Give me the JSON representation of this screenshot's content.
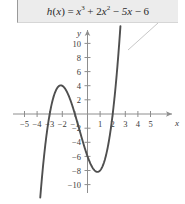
{
  "figure": {
    "name": "cubic-function-graph",
    "callout": {
      "equation_plain": "h(x) = x^3 + 2x^2 - 5x - 6",
      "lhs": "h",
      "lhs_arg_open": "(",
      "lhs_var": "x",
      "lhs_arg_close": ")",
      "equals": "=",
      "term1_base": "x",
      "term1_exp": "3",
      "op1": "+",
      "term2_coef": "2",
      "term2_base": "x",
      "term2_exp": "2",
      "op2": "−",
      "term3": "5x",
      "op3": "−",
      "term4": "6"
    },
    "axes": {
      "x_label": "x",
      "y_label": "y",
      "x_ticks": [
        "−5",
        "−4",
        "−3",
        "−2",
        "−1",
        "1",
        "2",
        "3",
        "4",
        "5"
      ],
      "y_ticks": [
        "10",
        "8",
        "6",
        "4",
        "2",
        "−2",
        "−4",
        "−6",
        "−8",
        "−10"
      ]
    }
  },
  "chart_data": {
    "type": "line",
    "xlabel": "x",
    "ylabel": "y",
    "xlim": [
      -5.6,
      5.6
    ],
    "ylim": [
      -11.5,
      12.5
    ],
    "xticks": [
      -5,
      -4,
      -3,
      -2,
      -1,
      1,
      2,
      3,
      4,
      5
    ],
    "yticks": [
      10,
      8,
      6,
      4,
      2,
      -2,
      -4,
      -6,
      -8,
      -10
    ],
    "grid": false,
    "legend": false,
    "series": [
      {
        "name": "h(x) = x^3 + 2x^2 - 5x - 6",
        "color": "#4f4f4f",
        "expression": "x**3 + 2*x**2 - 5*x - 6",
        "x": [
          -4.3,
          -4.1,
          -3.9,
          -3.7,
          -3.5,
          -3.3,
          -3.1,
          -2.9,
          -2.7,
          -2.5,
          -2.3,
          -2.1,
          -1.9,
          -1.7,
          -1.5,
          -1.3,
          -1.1,
          -0.9,
          -0.7,
          -0.5,
          -0.3,
          -0.1,
          0.1,
          0.3,
          0.5,
          0.7,
          0.9,
          1.1,
          1.3,
          1.5,
          1.7,
          1.9,
          2.1,
          2.3,
          2.5,
          2.65
        ],
        "y": [
          -27.0,
          -20.7,
          -15.2,
          -10.4,
          -6.4,
          -3.0,
          -0.3,
          1.8,
          3.4,
          4.4,
          5.0,
          5.1,
          4.9,
          4.4,
          3.6,
          2.7,
          1.6,
          0.4,
          -0.9,
          -2.1,
          -3.4,
          -4.5,
          -5.5,
          -6.3,
          -7.0,
          -7.2,
          -8.1,
          -7.75,
          -6.9,
          -5.6,
          -3.8,
          -1.4,
          1.6,
          5.2,
          9.6,
          12.3
        ]
      }
    ],
    "annotations": [
      {
        "text": "x-intercepts",
        "values": [
          -3,
          -1,
          2
        ]
      },
      {
        "text": "local maximum",
        "point": [
          -2.12,
          4.06
        ]
      },
      {
        "text": "local minimum",
        "point": [
          0.79,
          -8.21
        ]
      },
      {
        "text": "y-intercept",
        "point": [
          0,
          -6
        ]
      }
    ]
  }
}
